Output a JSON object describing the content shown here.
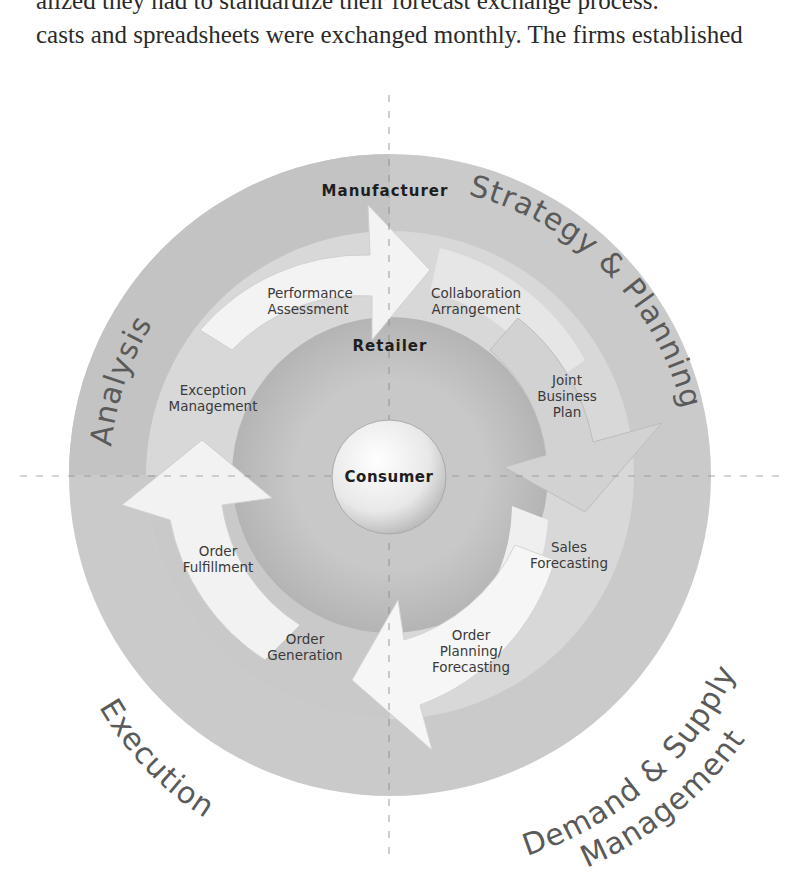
{
  "document": {
    "text_lines": [
      "alized they had to standardize their forecast exchange process.",
      "casts and spreadsheets were exchanged monthly. The firms established"
    ]
  },
  "diagram": {
    "colors": {
      "outer_ring": "#c9c9c9",
      "outer_ring_dark": "#b9b9b9",
      "arrow_band": "#dcdcdc",
      "inner_disk": "#c4c4c4",
      "arrow_fill": "#f4f4f4",
      "sphere": "#eeeeee",
      "quadrant_label": "#555555",
      "label_text": "#333333",
      "bold_text": "#1e1e1e",
      "dash_line": "#8a8a8a"
    },
    "quadrant_labels": {
      "top_left": "Analysis",
      "top_right": "Strategy & Planning",
      "bottom_left": "Execution",
      "bottom_right_1": "Demand & Supply",
      "bottom_right_2": "Management"
    },
    "ring_labels": {
      "outer": "Manufacturer",
      "inner": "Retailer",
      "center": "Consumer"
    },
    "steps": {
      "performance_assessment": [
        "Performance",
        "Assessment"
      ],
      "collaboration_arrangement": [
        "Collaboration",
        "Arrangement"
      ],
      "joint_business_plan": [
        "Joint",
        "Business",
        "Plan"
      ],
      "sales_forecasting": [
        "Sales",
        "Forecasting"
      ],
      "order_planning_forecasting": [
        "Order",
        "Planning/",
        "Forecasting"
      ],
      "order_generation": [
        "Order",
        "Generation"
      ],
      "order_fulfillment": [
        "Order",
        "Fulfillment"
      ],
      "exception_management": [
        "Exception",
        "Management"
      ]
    }
  }
}
